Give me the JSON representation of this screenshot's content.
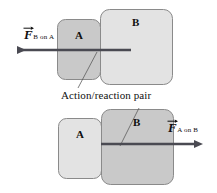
{
  "figure": {
    "caption": "Action/reaction pair",
    "colors": {
      "background": "#ffffff",
      "block_fill_light": "#e3e3e3",
      "block_fill_mid": "#d9d9d9",
      "block_fill_dark": "#c9c9c9",
      "block_stroke": "#8a8a8a",
      "arrow": "#4a4a52",
      "leader_line": "#5c5c5c",
      "text": "#101010"
    },
    "panels": [
      {
        "id": "top-panel",
        "name": "force-of-b-on-a",
        "blocks": [
          {
            "id": "top-block-a",
            "label": "A",
            "highlighted": true,
            "x": 57,
            "y": 19,
            "w": 44,
            "h": 61
          },
          {
            "id": "top-block-b",
            "label": "B",
            "highlighted": false,
            "x": 100,
            "y": 9,
            "w": 73,
            "h": 76
          }
        ],
        "arrow": {
          "name": "force-arrow-b-on-a",
          "direction": "left",
          "tail_x": 131,
          "tip_x": 14,
          "y": 50
        },
        "force": {
          "symbol": "F",
          "subscript": "B on A",
          "label_x": 13,
          "label_y": 28
        }
      },
      {
        "id": "bottom-panel",
        "name": "force-of-a-on-b",
        "blocks": [
          {
            "id": "bottom-block-a",
            "label": "A",
            "highlighted": false,
            "x": 58,
            "y": 118,
            "w": 44,
            "h": 61
          },
          {
            "id": "bottom-block-b",
            "label": "B",
            "highlighted": true,
            "x": 101,
            "y": 109,
            "w": 73,
            "h": 76
          }
        ],
        "arrow": {
          "name": "force-arrow-a-on-b",
          "direction": "right",
          "tail_x": 101,
          "tip_x": 197,
          "y": 144
        },
        "force": {
          "symbol": "F",
          "subscript": "A on B",
          "label_x": 168,
          "label_y": 121
        }
      }
    ],
    "leader_lines": [
      {
        "name": "leader-line-top",
        "x1": 97,
        "y1": 52,
        "x2": 78,
        "y2": 90
      },
      {
        "name": "leader-line-bottom",
        "x1": 139,
        "y1": 110,
        "x2": 120,
        "y2": 146
      }
    ],
    "caption_position": {
      "x": 61,
      "y": 90
    }
  }
}
